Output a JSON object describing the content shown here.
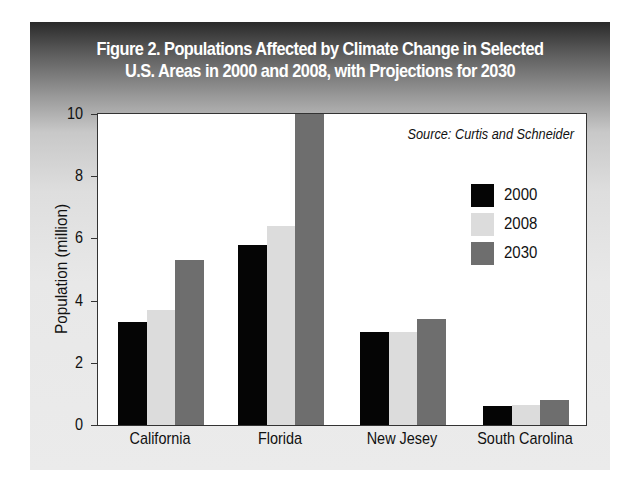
{
  "title_line1": "Figure 2. Populations Affected by Climate Change in Selected",
  "title_line2": "U.S. Areas in 2000 and 2008, with Projections for 2030",
  "source": "Source: Curtis and Schneider",
  "colors": {
    "2000": "#050505",
    "2008": "#dcdcdc",
    "2030": "#6e6e6e",
    "header_dark": "#2a2a2a",
    "panel_light": "#ebebeb"
  },
  "chart_data": {
    "type": "bar",
    "title": "Figure 2. Populations Affected by Climate Change in Selected U.S. Areas in 2000 and 2008, with Projections for 2030",
    "subtitle": "Source: Curtis and Schneider",
    "xlabel": "",
    "ylabel": "Population (million)",
    "ylim": [
      0,
      10
    ],
    "yticks": [
      0,
      2,
      4,
      6,
      8,
      10
    ],
    "grid": false,
    "legend_position": "upper right (inside plot)",
    "categories": [
      "California",
      "Florida",
      "New Jesey",
      "South Carolina"
    ],
    "series": [
      {
        "name": "2000",
        "values": [
          3.3,
          5.8,
          3.0,
          0.6
        ]
      },
      {
        "name": "2008",
        "values": [
          3.7,
          6.4,
          3.0,
          0.65
        ]
      },
      {
        "name": "2030",
        "values": [
          5.3,
          10.0,
          3.4,
          0.8
        ]
      }
    ]
  },
  "legend": [
    {
      "label": "2000"
    },
    {
      "label": "2008"
    },
    {
      "label": "2030"
    }
  ],
  "yaxis": {
    "title": "Population (million)",
    "ticks": [
      "0",
      "2",
      "4",
      "6",
      "8",
      "10"
    ]
  },
  "xaxis": {
    "labels": [
      "California",
      "Florida",
      "New Jesey",
      "South Carolina"
    ]
  }
}
